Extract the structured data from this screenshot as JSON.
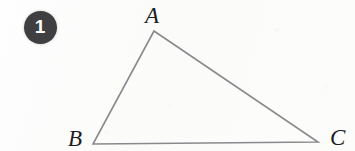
{
  "figure": {
    "kind": "geometry-diagram",
    "shape": "triangle",
    "background_color": "#fcfcfb"
  },
  "badge": {
    "number": "1",
    "fill_color": "#3f3f41",
    "text_color": "#fdfdfd",
    "center": {
      "x": 40,
      "y": 27
    },
    "radius": 16.5
  },
  "triangle": {
    "stroke_color": "#8a8a8e",
    "stroke_width": 1.6,
    "vertices": [
      {
        "name": "A",
        "x": 154,
        "y": 31
      },
      {
        "name": "B",
        "x": 93,
        "y": 144
      },
      {
        "name": "C",
        "x": 318,
        "y": 142
      }
    ],
    "labels": [
      {
        "text": "A",
        "x": 145,
        "y": 4
      },
      {
        "text": "B",
        "x": 68,
        "y": 127
      },
      {
        "text": "C",
        "x": 330,
        "y": 126
      }
    ]
  }
}
